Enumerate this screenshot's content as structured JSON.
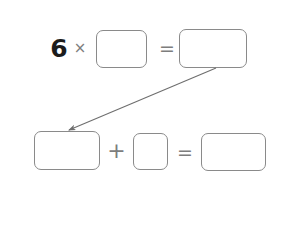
{
  "worksheet": {
    "background_color": "#ffffff",
    "box_border_color": "#8a8a8a",
    "operator_color": "#7d7d7d",
    "numeral_color": "#1c1c1c",
    "arrow_color": "#6e6e6e"
  },
  "equations": {
    "top": {
      "multiplicand": "6",
      "times_symbol": "×",
      "equals_symbol": "=",
      "factor_box_value": "",
      "factor_box_placeholder": "",
      "product_box_value": "",
      "product_box_placeholder": ""
    },
    "bottom": {
      "plus_symbol": "+",
      "equals_symbol": "=",
      "addend_one_value": "",
      "addend_one_placeholder": "",
      "addend_two_value": "",
      "addend_two_placeholder": "",
      "sum_value": "",
      "sum_placeholder": ""
    }
  },
  "arrow": {
    "label": "",
    "from": "product-box",
    "to": "addend-one-box"
  }
}
